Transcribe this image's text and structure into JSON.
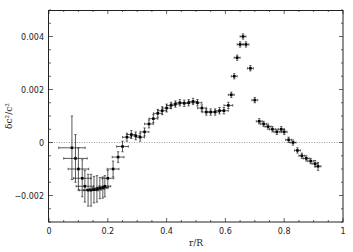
{
  "chart_data": {
    "type": "scatter",
    "title": "",
    "xlabel": "r/R",
    "ylabel": "δc²/c²",
    "xlim": [
      0,
      1
    ],
    "ylim": [
      -0.003,
      0.005
    ],
    "x_ticks": [
      0,
      0.2,
      0.4,
      0.6,
      0.8,
      1
    ],
    "x_tick_labels": [
      "0",
      "0.2",
      "0.4",
      "0.6",
      "0.8",
      "1"
    ],
    "y_ticks": [
      -0.002,
      0,
      0.002,
      0.004
    ],
    "y_tick_labels": [
      "-0.002",
      "0",
      "0.002",
      "0.004"
    ],
    "grid": false,
    "reference_line": {
      "y": 0,
      "style": "dotted"
    },
    "legend": null,
    "series": [
      {
        "name": "data",
        "marker": "point with error bars",
        "points": [
          {
            "x": 0.078,
            "y": -0.0002,
            "xerr": 0.045,
            "yerr": 0.0012
          },
          {
            "x": 0.09,
            "y": -0.0006,
            "xerr": 0.04,
            "yerr": 0.0009
          },
          {
            "x": 0.1,
            "y": -0.001,
            "xerr": 0.035,
            "yerr": 0.0008
          },
          {
            "x": 0.113,
            "y": -0.00135,
            "xerr": 0.03,
            "yerr": 0.0007
          },
          {
            "x": 0.122,
            "y": -0.00165,
            "xerr": 0.03,
            "yerr": 0.0006
          },
          {
            "x": 0.133,
            "y": -0.0018,
            "xerr": 0.03,
            "yerr": 0.0006
          },
          {
            "x": 0.143,
            "y": -0.0018,
            "xerr": 0.025,
            "yerr": 0.0006
          },
          {
            "x": 0.153,
            "y": -0.00178,
            "xerr": 0.025,
            "yerr": 0.0005
          },
          {
            "x": 0.163,
            "y": -0.00175,
            "xerr": 0.025,
            "yerr": 0.0005
          },
          {
            "x": 0.173,
            "y": -0.00172,
            "xerr": 0.025,
            "yerr": 0.0004
          },
          {
            "x": 0.183,
            "y": -0.0017,
            "xerr": 0.02,
            "yerr": 0.0004
          },
          {
            "x": 0.19,
            "y": -0.00165,
            "xerr": 0.02,
            "yerr": 0.0004
          },
          {
            "x": 0.2,
            "y": -0.00135,
            "xerr": 0.02,
            "yerr": 0.0003
          },
          {
            "x": 0.218,
            "y": -0.001,
            "xerr": 0.02,
            "yerr": 0.0003
          },
          {
            "x": 0.235,
            "y": -0.00055,
            "xerr": 0.02,
            "yerr": 0.0002
          },
          {
            "x": 0.25,
            "y": -0.00015,
            "xerr": 0.02,
            "yerr": 0.0002
          },
          {
            "x": 0.265,
            "y": 0.0002,
            "xerr": 0.015,
            "yerr": 0.00015
          },
          {
            "x": 0.28,
            "y": 0.0003,
            "xerr": 0.015,
            "yerr": 0.00015
          },
          {
            "x": 0.295,
            "y": 0.00025,
            "xerr": 0.015,
            "yerr": 0.00015
          },
          {
            "x": 0.31,
            "y": 0.0002,
            "xerr": 0.015,
            "yerr": 0.00015
          },
          {
            "x": 0.325,
            "y": 0.0004,
            "xerr": 0.015,
            "yerr": 0.00015
          },
          {
            "x": 0.34,
            "y": 0.0007,
            "xerr": 0.015,
            "yerr": 0.00015
          },
          {
            "x": 0.355,
            "y": 0.0009,
            "xerr": 0.015,
            "yerr": 0.00015
          },
          {
            "x": 0.37,
            "y": 0.0011,
            "xerr": 0.015,
            "yerr": 0.00015
          },
          {
            "x": 0.385,
            "y": 0.0012,
            "xerr": 0.015,
            "yerr": 0.00015
          },
          {
            "x": 0.4,
            "y": 0.0013,
            "xerr": 0.015,
            "yerr": 0.00015
          },
          {
            "x": 0.415,
            "y": 0.0014,
            "xerr": 0.015,
            "yerr": 0.00012
          },
          {
            "x": 0.43,
            "y": 0.00145,
            "xerr": 0.015,
            "yerr": 0.00012
          },
          {
            "x": 0.445,
            "y": 0.0015,
            "xerr": 0.015,
            "yerr": 0.00012
          },
          {
            "x": 0.46,
            "y": 0.00148,
            "xerr": 0.015,
            "yerr": 0.00012
          },
          {
            "x": 0.475,
            "y": 0.0015,
            "xerr": 0.015,
            "yerr": 0.00012
          },
          {
            "x": 0.49,
            "y": 0.00155,
            "xerr": 0.015,
            "yerr": 0.00012
          },
          {
            "x": 0.505,
            "y": 0.0015,
            "xerr": 0.015,
            "yerr": 0.00012
          },
          {
            "x": 0.52,
            "y": 0.0013,
            "xerr": 0.015,
            "yerr": 0.00012
          },
          {
            "x": 0.535,
            "y": 0.00115,
            "xerr": 0.015,
            "yerr": 0.00012
          },
          {
            "x": 0.55,
            "y": 0.00115,
            "xerr": 0.015,
            "yerr": 0.00012
          },
          {
            "x": 0.565,
            "y": 0.00115,
            "xerr": 0.015,
            "yerr": 0.00012
          },
          {
            "x": 0.58,
            "y": 0.0012,
            "xerr": 0.015,
            "yerr": 0.00012
          },
          {
            "x": 0.595,
            "y": 0.0012,
            "xerr": 0.015,
            "yerr": 0.00012
          },
          {
            "x": 0.61,
            "y": 0.0014,
            "xerr": 0.015,
            "yerr": 0.00012
          },
          {
            "x": 0.62,
            "y": 0.0018,
            "xerr": 0.01,
            "yerr": 0.0001
          },
          {
            "x": 0.63,
            "y": 0.0025,
            "xerr": 0.01,
            "yerr": 0.0001
          },
          {
            "x": 0.64,
            "y": 0.0032,
            "xerr": 0.01,
            "yerr": 0.0001
          },
          {
            "x": 0.65,
            "y": 0.0037,
            "xerr": 0.01,
            "yerr": 0.0001
          },
          {
            "x": 0.66,
            "y": 0.004,
            "xerr": 0.01,
            "yerr": 0.0001
          },
          {
            "x": 0.67,
            "y": 0.0037,
            "xerr": 0.01,
            "yerr": 0.0001
          },
          {
            "x": 0.685,
            "y": 0.0028,
            "xerr": 0.01,
            "yerr": 0.0001
          },
          {
            "x": 0.7,
            "y": 0.0016,
            "xerr": 0.01,
            "yerr": 0.0001
          },
          {
            "x": 0.715,
            "y": 0.0008,
            "xerr": 0.01,
            "yerr": 0.0001
          },
          {
            "x": 0.73,
            "y": 0.0007,
            "xerr": 0.01,
            "yerr": 0.0001
          },
          {
            "x": 0.745,
            "y": 0.0006,
            "xerr": 0.01,
            "yerr": 0.0001
          },
          {
            "x": 0.76,
            "y": 0.0005,
            "xerr": 0.01,
            "yerr": 0.0001
          },
          {
            "x": 0.775,
            "y": 0.0004,
            "xerr": 0.01,
            "yerr": 0.0001
          },
          {
            "x": 0.79,
            "y": 0.0005,
            "xerr": 0.01,
            "yerr": 0.0001
          },
          {
            "x": 0.8,
            "y": 0.0004,
            "xerr": 0.01,
            "yerr": 0.0001
          },
          {
            "x": 0.815,
            "y": 0.0001,
            "xerr": 0.01,
            "yerr": 0.0001
          },
          {
            "x": 0.83,
            "y": 0.0,
            "xerr": 0.01,
            "yerr": 0.0001
          },
          {
            "x": 0.845,
            "y": -0.0003,
            "xerr": 0.01,
            "yerr": 0.0001
          },
          {
            "x": 0.86,
            "y": -0.0005,
            "xerr": 0.01,
            "yerr": 0.0001
          },
          {
            "x": 0.875,
            "y": -0.0006,
            "xerr": 0.01,
            "yerr": 0.0001
          },
          {
            "x": 0.89,
            "y": -0.0007,
            "xerr": 0.01,
            "yerr": 0.0001
          },
          {
            "x": 0.905,
            "y": -0.0008,
            "xerr": 0.01,
            "yerr": 0.00012
          },
          {
            "x": 0.915,
            "y": -0.0009,
            "xerr": 0.01,
            "yerr": 0.00015
          }
        ]
      }
    ]
  }
}
